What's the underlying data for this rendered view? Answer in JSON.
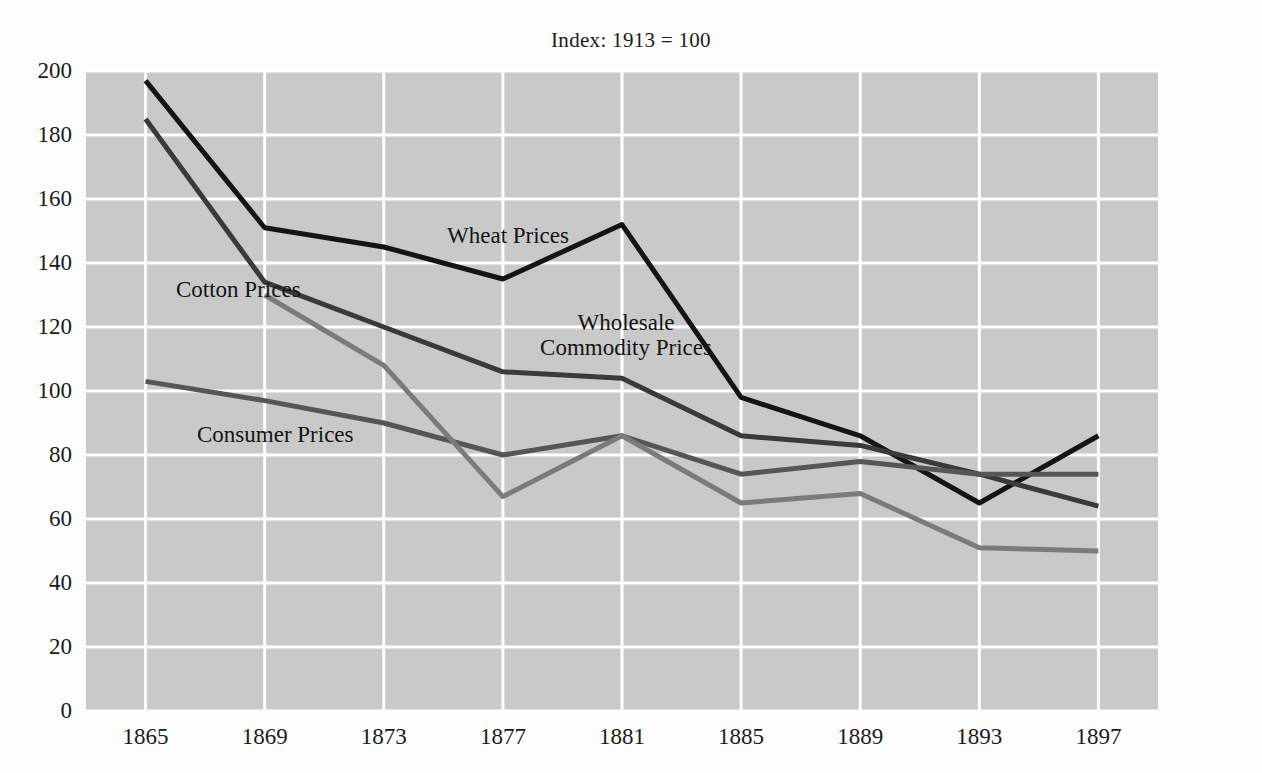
{
  "chart_data": {
    "type": "line",
    "title": "Index: 1913 = 100",
    "subtitle": "",
    "xlabel": "",
    "ylabel": "",
    "x": [
      1865,
      1869,
      1873,
      1877,
      1881,
      1885,
      1889,
      1893,
      1897
    ],
    "categories": [
      "1865",
      "1869",
      "1873",
      "1877",
      "1881",
      "1885",
      "1889",
      "1893",
      "1897"
    ],
    "xlim": [
      1863,
      1899
    ],
    "ylim": [
      0,
      200
    ],
    "yticks": [
      0,
      20,
      40,
      60,
      80,
      100,
      120,
      140,
      160,
      180,
      200
    ],
    "ytick_labels": [
      "0",
      "20",
      "40",
      "60",
      "80",
      "100",
      "120",
      "140",
      "160",
      "180",
      "200"
    ],
    "grid": true,
    "grid_color": "#ffffff",
    "plot_background": "#c9c9c9",
    "legend": "inline-annotations",
    "series": [
      {
        "name": "Wheat Prices",
        "color": "#141414",
        "values": [
          197,
          151,
          145,
          135,
          152,
          98,
          86,
          65,
          86
        ]
      },
      {
        "name": "Wholesale Commodity Prices",
        "color": "#3a3a3a",
        "values": [
          185,
          134,
          120,
          106,
          104,
          86,
          83,
          74,
          64
        ]
      },
      {
        "name": "Consumer Prices",
        "color": "#565656",
        "values": [
          103,
          97,
          90,
          80,
          86,
          74,
          78,
          74,
          74
        ]
      },
      {
        "name": "Cotton Prices",
        "color": "#7b7b7b",
        "values": [
          null,
          130,
          108,
          67,
          86,
          65,
          68,
          51,
          50
        ]
      }
    ],
    "annotations": [
      {
        "text": "Wheat Prices",
        "lines": [
          "Wheat Prices"
        ],
        "x_px": 447,
        "y_px": 224,
        "align": "left"
      },
      {
        "text": "Cotton Prices",
        "lines": [
          "Cotton Prices"
        ],
        "x_px": 176,
        "y_px": 278,
        "align": "left"
      },
      {
        "text": "Wholesale Commodity Prices",
        "lines": [
          "Wholesale",
          "Commodity Prices"
        ],
        "x_px": 626,
        "y_px": 311,
        "align": "center"
      },
      {
        "text": "Consumer Prices",
        "lines": [
          "Consumer Prices"
        ],
        "x_px": 197,
        "y_px": 423,
        "align": "left"
      }
    ]
  }
}
